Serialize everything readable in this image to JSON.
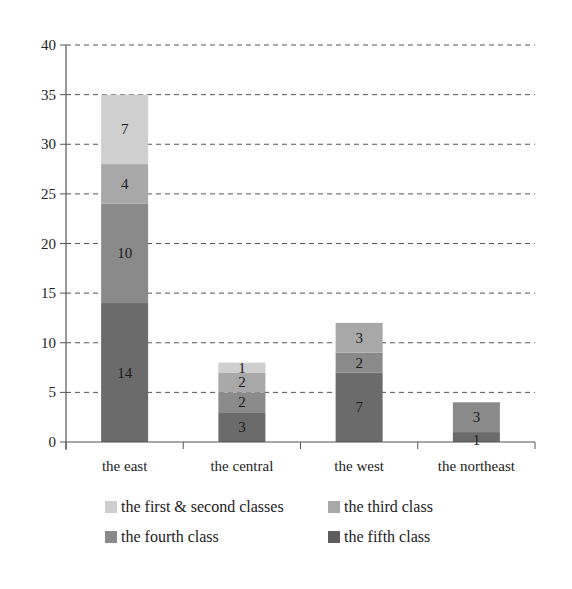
{
  "chart_data": {
    "type": "bar",
    "stacked": true,
    "title": "",
    "xlabel": "",
    "ylabel": "",
    "ylim": [
      0,
      40
    ],
    "yticks": [
      0,
      5,
      10,
      15,
      20,
      25,
      30,
      35,
      40
    ],
    "grid": "horizontal dashed",
    "legend_position": "bottom",
    "categories": [
      "the east",
      "the central",
      "the west",
      "the northeast"
    ],
    "series": [
      {
        "name": "the fifth class",
        "color": "#6b6b6b",
        "values": [
          14,
          3,
          7,
          1
        ]
      },
      {
        "name": "the fourth class",
        "color": "#8a8a8a",
        "values": [
          10,
          2,
          2,
          3
        ]
      },
      {
        "name": "the third class",
        "color": "#a8a8a8",
        "values": [
          4,
          2,
          3,
          0
        ]
      },
      {
        "name": "the first & second classes",
        "color": "#cfcfcf",
        "values": [
          7,
          1,
          0,
          0
        ]
      }
    ],
    "totals": [
      35,
      8,
      12,
      4
    ]
  },
  "legend": [
    {
      "label": "the first & second classes",
      "color": "#cfcfcf"
    },
    {
      "label": "the third class",
      "color": "#a8a8a8"
    },
    {
      "label": "the fourth class",
      "color": "#8a8a8a"
    },
    {
      "label": "the fifth class",
      "color": "#5e5e5e"
    }
  ]
}
